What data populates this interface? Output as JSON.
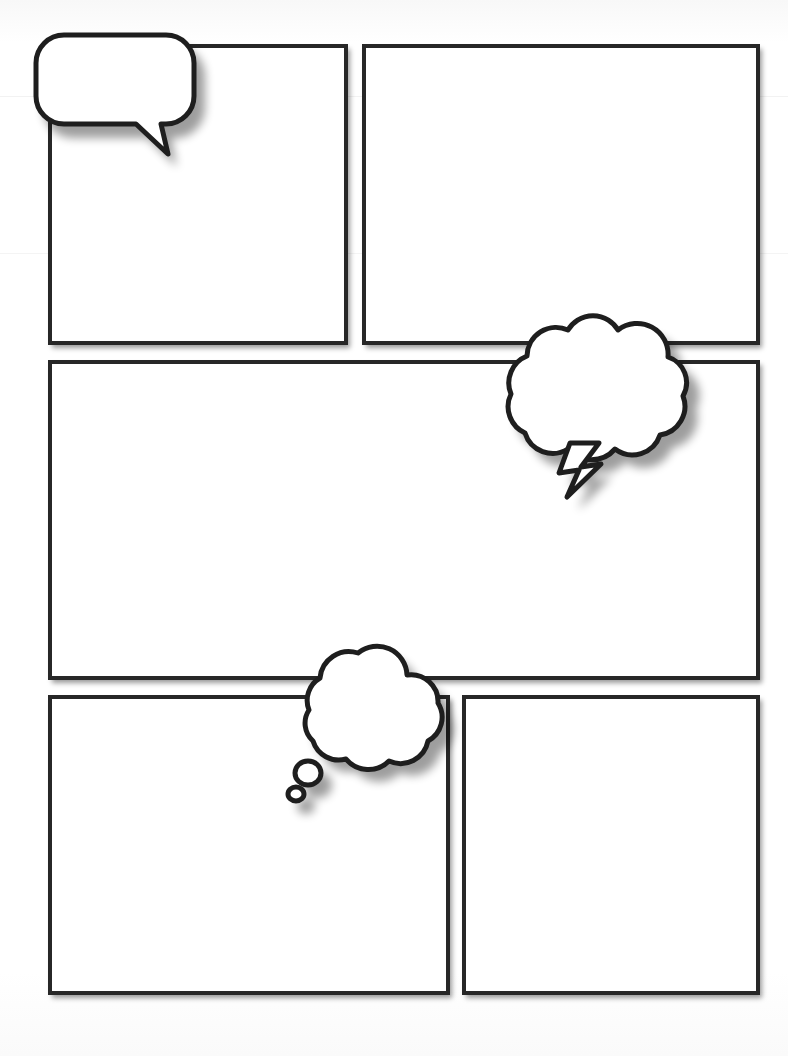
{
  "page": {
    "kind": "comic-layout-worksheet",
    "width": 788,
    "height": 1056,
    "background_color": "#fdfdfd",
    "ink_color": "#272727",
    "balloon_fill_color": "#ffffff",
    "balloon_outline_color": "#1e1e1e",
    "shadow_color": "#000000",
    "panel_count": 5,
    "balloon_count": 3
  },
  "panels": [
    {
      "id": "panel-1",
      "name": "top-left-panel",
      "row": 1,
      "column": 1,
      "caption": "",
      "x": 48,
      "y": 44,
      "width": 300,
      "height": 301
    },
    {
      "id": "panel-2",
      "name": "top-right-panel",
      "row": 1,
      "column": 2,
      "caption": "",
      "x": 362,
      "y": 44,
      "width": 398,
      "height": 301
    },
    {
      "id": "panel-3",
      "name": "middle-wide-panel",
      "row": 2,
      "column": 1,
      "caption": "",
      "x": 48,
      "y": 360,
      "width": 712,
      "height": 320
    },
    {
      "id": "panel-4",
      "name": "bottom-left-panel",
      "row": 3,
      "column": 1,
      "caption": "",
      "x": 48,
      "y": 695,
      "width": 402,
      "height": 300
    },
    {
      "id": "panel-5",
      "name": "bottom-right-panel",
      "row": 3,
      "column": 2,
      "caption": "",
      "x": 462,
      "y": 695,
      "width": 298,
      "height": 300
    }
  ],
  "balloons": [
    {
      "id": "balloon-1",
      "name": "speech-balloon",
      "type": "speech",
      "text": "",
      "tail_direction": "down-right",
      "x": 28,
      "y": 26,
      "width": 160,
      "height": 135,
      "attached_panel": "panel-1"
    },
    {
      "id": "balloon-2",
      "name": "burst-balloon",
      "type": "burst-cloud",
      "text": "",
      "tail_direction": "down-lightning",
      "x": 498,
      "y": 305,
      "width": 205,
      "height": 195,
      "attached_panel": "panel-3"
    },
    {
      "id": "balloon-3",
      "name": "thought-balloon",
      "type": "thought",
      "text": "",
      "tail_direction": "down-left-bubbles",
      "bubble_trail_count": 2,
      "x": 282,
      "y": 640,
      "width": 175,
      "height": 165,
      "attached_panel": "panel-4"
    }
  ]
}
